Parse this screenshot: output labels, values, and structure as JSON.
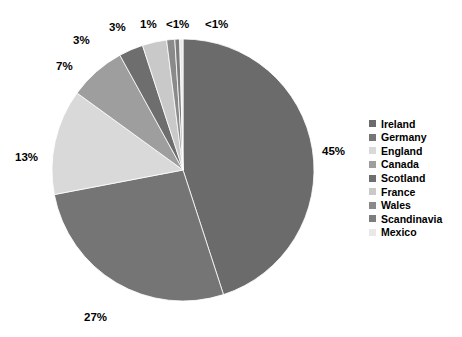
{
  "chart_data": {
    "type": "pie",
    "title": "",
    "subtitle": "",
    "xlabel": "",
    "ylabel": "",
    "grid": false,
    "legend_position": "right",
    "start_angle_deg": 0,
    "direction": "clockwise",
    "categories": [
      "Ireland",
      "Germany",
      "England",
      "Canada",
      "Scotland",
      "France",
      "Wales",
      "Scandinavia",
      "Mexico"
    ],
    "values": [
      45,
      27,
      13,
      7,
      3,
      3,
      1,
      0.6,
      0.4
    ],
    "data_labels": [
      "45%",
      "27%",
      "13%",
      "7%",
      "3%",
      "3%",
      "1%",
      "<1%",
      "<1%"
    ],
    "colors": [
      "#6b6b6b",
      "#757575",
      "#d9d9d9",
      "#9e9e9e",
      "#6e6e6e",
      "#c9c9c9",
      "#8a8a8a",
      "#7d7d7d",
      "#e8e8e8"
    ],
    "slices": [
      {
        "label": "Ireland",
        "value": 45,
        "display": "45%",
        "color": "#6b6b6b"
      },
      {
        "label": "Germany",
        "value": 27,
        "display": "27%",
        "color": "#757575"
      },
      {
        "label": "England",
        "value": 13,
        "display": "13%",
        "color": "#d9d9d9"
      },
      {
        "label": "Canada",
        "value": 7,
        "display": "7%",
        "color": "#9e9e9e"
      },
      {
        "label": "Scotland",
        "value": 3,
        "display": "3%",
        "color": "#6e6e6e"
      },
      {
        "label": "France",
        "value": 3,
        "display": "3%",
        "color": "#c9c9c9"
      },
      {
        "label": "Wales",
        "value": 1,
        "display": "1%",
        "color": "#8a8a8a"
      },
      {
        "label": "Scandinavia",
        "value": 0.6,
        "display": "<1%",
        "color": "#7d7d7d"
      },
      {
        "label": "Mexico",
        "value": 0.4,
        "display": "<1%",
        "color": "#e8e8e8"
      }
    ]
  },
  "labels": {
    "ireland": "45%",
    "germany": "27%",
    "england": "13%",
    "canada": "7%",
    "scotland": "3%",
    "france": "3%",
    "wales": "1%",
    "scandinavia": "<1%",
    "mexico": "<1%"
  },
  "legend": {
    "items": [
      {
        "label": "Ireland",
        "color": "#6b6b6b"
      },
      {
        "label": "Germany",
        "color": "#757575"
      },
      {
        "label": "England",
        "color": "#d9d9d9"
      },
      {
        "label": "Canada",
        "color": "#9e9e9e"
      },
      {
        "label": "Scotland",
        "color": "#6e6e6e"
      },
      {
        "label": "France",
        "color": "#c9c9c9"
      },
      {
        "label": "Wales",
        "color": "#8a8a8a"
      },
      {
        "label": "Scandinavia",
        "color": "#7d7d7d"
      },
      {
        "label": "Mexico",
        "color": "#e8e8e8"
      }
    ]
  },
  "geometry": {
    "center_x": 183,
    "center_y": 170,
    "radius": 131
  }
}
